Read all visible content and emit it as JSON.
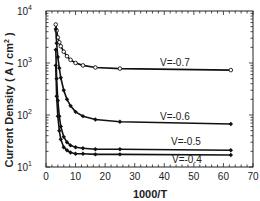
{
  "chart_data": {
    "type": "line",
    "title": "",
    "xlabel": "1000/T",
    "ylabel": "Current Density (A/cm2)",
    "ylabel_display": "Current  Density  ( A / cm",
    "ylabel_sup": "2",
    "ylabel_close": " )",
    "xlim": [
      0,
      70
    ],
    "ylim": [
      10,
      10000
    ],
    "yscale": "log",
    "grid": false,
    "x_ticks": [
      0,
      10,
      20,
      30,
      40,
      50,
      60,
      70
    ],
    "y_ticks": [
      {
        "base": "10",
        "exp": "1",
        "value": 10
      },
      {
        "base": "10",
        "exp": "2",
        "value": 100
      },
      {
        "base": "10",
        "exp": "3",
        "value": 1000
      },
      {
        "base": "10",
        "exp": "4",
        "value": 10000
      }
    ],
    "x": [
      3.3,
      3.6,
      4.0,
      4.5,
      5.0,
      6.0,
      7.1,
      8.3,
      10.0,
      12.5,
      16.7,
      25.0,
      62.5
    ],
    "series": [
      {
        "name": "V=-0.7",
        "label": "V=-0.7",
        "marker": "open-circle",
        "values": [
          5500,
          4200,
          3100,
          2500,
          2100,
          1650,
          1350,
          1150,
          1000,
          900,
          820,
          780,
          730
        ],
        "label_pos": [
          160,
          66
        ]
      },
      {
        "name": "V=-0.6",
        "label": "V=-0.6",
        "marker": "filled-diamond",
        "values": [
          4500,
          2400,
          1300,
          800,
          520,
          300,
          200,
          150,
          115,
          95,
          82,
          74,
          67
        ],
        "label_pos": [
          160,
          120
        ]
      },
      {
        "name": "V=-0.5",
        "label": "V=-0.5",
        "marker": "filled-diamond",
        "values": [
          1800,
          500,
          190,
          95,
          60,
          38,
          30,
          26,
          24,
          23,
          22,
          22,
          21
        ],
        "label_pos": [
          171,
          145
        ]
      },
      {
        "name": "V=-0.4",
        "label": "V=-0.4",
        "marker": "filled-diamond",
        "values": [
          900,
          230,
          95,
          50,
          34,
          24,
          21,
          19,
          18,
          18,
          17.5,
          17.5,
          17
        ],
        "label_pos": [
          172,
          163
        ]
      }
    ]
  }
}
